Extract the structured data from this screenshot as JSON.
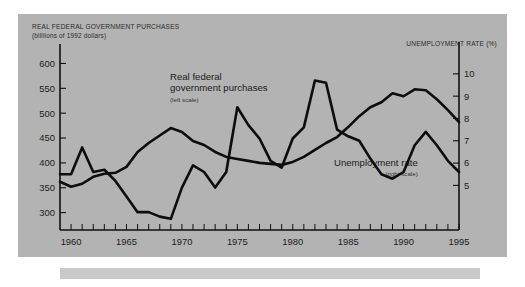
{
  "figure": {
    "title_left_line1": "REAL FEDERAL GOVERNMENT PURCHASES",
    "title_left_line2": "(billlions of 1992 dollars)",
    "title_right": "UNEMPLOYMENT RATE (%)",
    "background_color": "#b3b3b3",
    "line_color": "#0d0d0d",
    "axis_color": "#111111"
  },
  "annotations": {
    "purchases_label_line1": "Real federal",
    "purchases_label_line2": "government purchases",
    "purchases_scale": "(left scale)",
    "unemployment_label": "Unemployment rate",
    "unemployment_scale": "(right scale)"
  },
  "chart_data": {
    "type": "line",
    "title": "REAL FEDERAL GOVERNMENT PURCHASES",
    "xlabel": "",
    "ylabel": "billlions of 1992 dollars",
    "y2label": "Unemployment rate (%)",
    "grid": false,
    "legend": "annotated-inline",
    "xlim": [
      1959,
      1995
    ],
    "ylim": [
      265,
      615
    ],
    "y2lim": [
      3.0,
      10.8
    ],
    "x_tick_labels": [
      1960,
      1965,
      1970,
      1975,
      1980,
      1985,
      1990,
      1995
    ],
    "x_tick_minor_step": 1,
    "y_ticks_left": [
      300,
      350,
      400,
      450,
      500,
      550,
      600
    ],
    "y_ticks_right": [
      5,
      6,
      7,
      8,
      9,
      10
    ],
    "x": [
      1959,
      1960,
      1961,
      1962,
      1963,
      1964,
      1965,
      1966,
      1967,
      1968,
      1969,
      1970,
      1971,
      1972,
      1973,
      1974,
      1975,
      1976,
      1977,
      1978,
      1979,
      1980,
      1981,
      1982,
      1983,
      1984,
      1985,
      1986,
      1987,
      1988,
      1989,
      1990,
      1991,
      1992,
      1993,
      1994,
      1995
    ],
    "series": [
      {
        "name": "Real federal government purchases",
        "axis": "left",
        "units": "billions of 1992 dollars",
        "values": [
          362,
          352,
          358,
          372,
          378,
          380,
          392,
          422,
          440,
          455,
          470,
          462,
          444,
          436,
          422,
          412,
          408,
          404,
          400,
          398,
          396,
          402,
          412,
          426,
          440,
          452,
          472,
          494,
          512,
          522,
          540,
          534,
          548,
          546,
          528,
          506,
          482
        ]
      },
      {
        "name": "Unemployment rate",
        "axis": "right",
        "units": "percent",
        "values": [
          5.5,
          5.5,
          6.7,
          5.6,
          5.7,
          5.2,
          4.5,
          3.8,
          3.8,
          3.6,
          3.5,
          4.9,
          5.9,
          5.6,
          4.9,
          5.6,
          8.5,
          7.7,
          7.1,
          6.1,
          5.8,
          7.1,
          7.6,
          9.7,
          9.6,
          7.5,
          7.2,
          7.0,
          6.2,
          5.5,
          5.3,
          5.6,
          6.8,
          7.4,
          6.8,
          6.1,
          5.6
        ]
      }
    ]
  }
}
